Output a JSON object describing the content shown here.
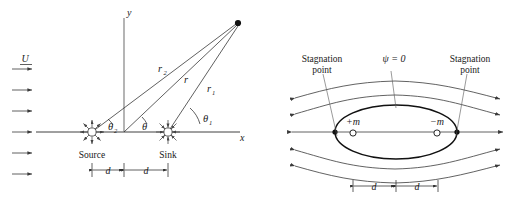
{
  "figure": {
    "panels": [
      "left-source-sink-geometry",
      "right-rankine-oval-streamlines"
    ]
  },
  "left_panel": {
    "name": "source-sink-geometry",
    "freestream_label": "U",
    "freestream_arrow_count": 6,
    "axis_labels": {
      "x": "x",
      "y": "y"
    },
    "singularities": [
      {
        "name": "source",
        "label": "Source",
        "symbol": "outward-burst",
        "x_offset": "-d"
      },
      {
        "name": "sink",
        "label": "Sink",
        "symbol": "inward-burst",
        "x_offset": "+d"
      }
    ],
    "radii": [
      {
        "name": "r2",
        "label": "r",
        "subscript": "2",
        "from": "source",
        "to": "field-point"
      },
      {
        "name": "r",
        "label": "r",
        "subscript": "",
        "from": "origin",
        "to": "field-point"
      },
      {
        "name": "r1",
        "label": "r",
        "subscript": "1",
        "from": "sink",
        "to": "field-point"
      }
    ],
    "angles": [
      {
        "name": "theta2",
        "label": "θ",
        "subscript": "2",
        "vertex": "source"
      },
      {
        "name": "theta",
        "label": "θ",
        "subscript": "",
        "vertex": "origin"
      },
      {
        "name": "theta1",
        "label": "θ",
        "subscript": "1",
        "vertex": "sink"
      }
    ],
    "dimensions": [
      {
        "name": "d-left",
        "label": "d"
      },
      {
        "name": "d-right",
        "label": "d"
      }
    ],
    "field_point": {
      "name": "field-point",
      "marker": "filled-dot"
    }
  },
  "right_panel": {
    "name": "rankine-oval-streamlines",
    "streamline_label": "ψ = 0",
    "stagnation_points": [
      {
        "name": "stagnation-point-left",
        "line1": "Stagnation",
        "line2": "point"
      },
      {
        "name": "stagnation-point-right",
        "line1": "Stagnation",
        "line2": "point"
      }
    ],
    "singularities": [
      {
        "name": "source-strength",
        "label": "+m",
        "marker": "open-circle"
      },
      {
        "name": "sink-strength",
        "label": "−m",
        "marker": "open-circle"
      }
    ],
    "dimensions": [
      {
        "name": "d-left",
        "label": "d"
      },
      {
        "name": "d-right",
        "label": "d"
      }
    ],
    "streamline_count_above": 2,
    "streamline_count_below": 2,
    "centerline": "axis-of-symmetry"
  },
  "colors": {
    "ink": "#1a1a1a",
    "line": "#2b2b2b",
    "stream": "#3a3a3a",
    "axis": "#777777",
    "oval": "#111111",
    "background": "#ffffff"
  }
}
